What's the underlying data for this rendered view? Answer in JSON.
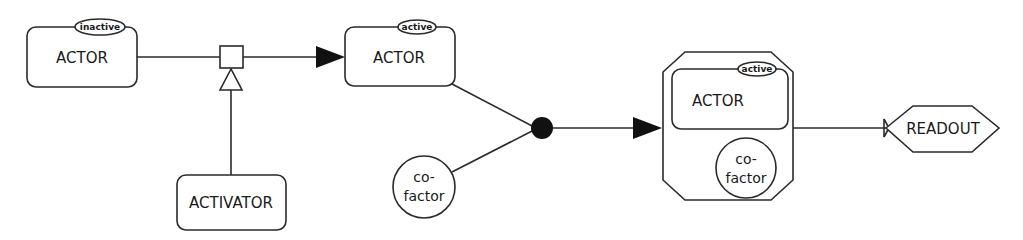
{
  "diagram": {
    "type": "SBGN process description",
    "nodes": {
      "actor_inactive": {
        "label": "ACTOR",
        "state": "inactive"
      },
      "activator": {
        "label": "ACTIVATOR"
      },
      "actor_active": {
        "label": "ACTOR",
        "state": "active"
      },
      "cofactor": {
        "label_line1": "co-",
        "label_line2": "factor"
      },
      "complex": {
        "actor": {
          "label": "ACTOR",
          "state": "active"
        },
        "cofactor": {
          "label_line1": "co-",
          "label_line2": "factor"
        }
      },
      "readout": {
        "label": "READOUT"
      }
    },
    "edges": [
      {
        "from": "actor_inactive",
        "to": "actor_active",
        "type": "process",
        "via": "process-node"
      },
      {
        "from": "activator",
        "to": "process-node",
        "type": "stimulation"
      },
      {
        "from": "actor_active",
        "to": "association-node",
        "type": "consumption"
      },
      {
        "from": "cofactor",
        "to": "association-node",
        "type": "consumption"
      },
      {
        "from": "association-node",
        "to": "complex",
        "type": "production"
      },
      {
        "from": "complex",
        "to": "readout",
        "type": "necessary-stimulation"
      }
    ],
    "colors": {
      "stroke": "#2a2a2a",
      "fill": "#ffffff",
      "text": "#1a1a1a"
    }
  }
}
